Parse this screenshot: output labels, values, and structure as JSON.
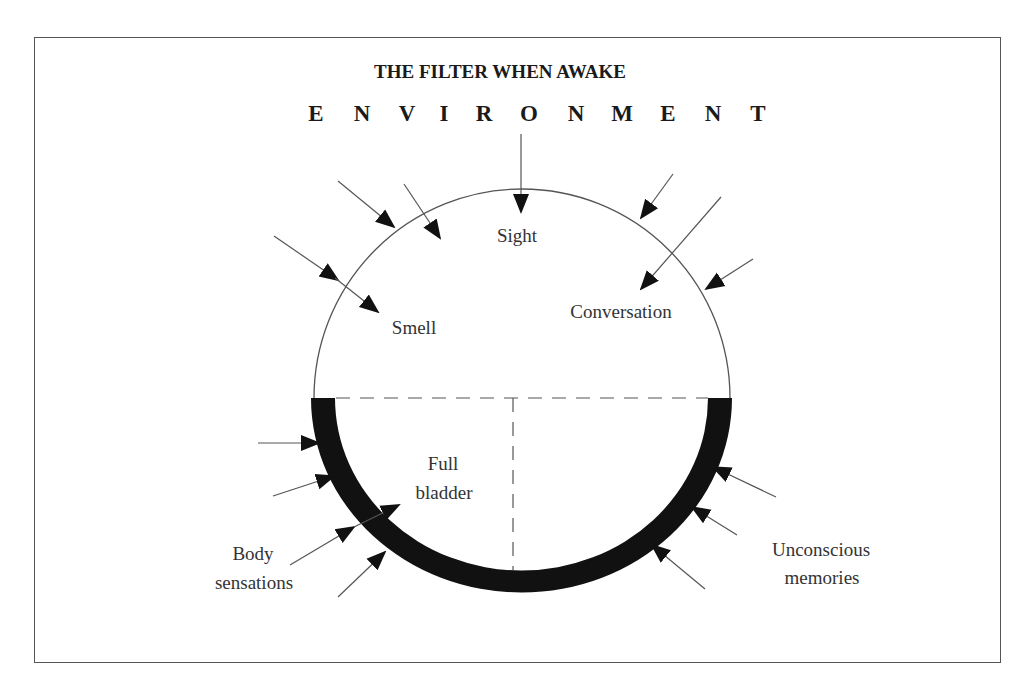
{
  "diagram": {
    "title": "THE FILTER WHEN AWAKE",
    "environment_letters": [
      "E",
      "N",
      "V",
      "I",
      "R",
      "O",
      "N",
      "M",
      "E",
      "N",
      "T"
    ],
    "labels": {
      "sight": "Sight",
      "smell": "Smell",
      "conversation": "Conversation",
      "full_bladder_line1": "Full",
      "full_bladder_line2": "bladder",
      "body_sensations_line1": "Body",
      "body_sensations_line2": "sensations",
      "unconscious_memories_line1": "Unconscious",
      "unconscious_memories_line2": "memories"
    },
    "colors": {
      "line": "#444444",
      "band": "#111111",
      "text": "#333333"
    },
    "structure": {
      "upper_half": "thin outline (conscious senses: sight, smell, conversation)",
      "lower_half": "thick black band (internal signals: body sensations, full bladder, unconscious memories)",
      "divider": "dashed horizontal line across diameter with dashed vertical line down to bottom"
    }
  }
}
